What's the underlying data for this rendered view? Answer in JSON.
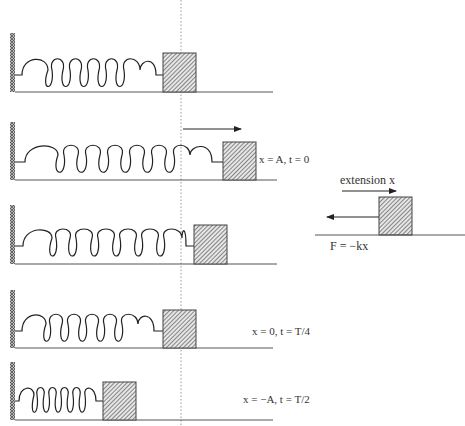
{
  "diagram": {
    "equilibrium_line": {
      "style": "dotted",
      "x": 181
    },
    "panels": [
      {
        "id": "rest",
        "label": "",
        "block_x": 163,
        "ground_y": 92,
        "spring_end": 163,
        "coils": 7,
        "arrow": false
      },
      {
        "id": "extended",
        "label": "x = A, t = 0",
        "block_x": 223,
        "ground_y": 180,
        "spring_end": 223,
        "coils": 6,
        "arrow": true
      },
      {
        "id": "intermediate",
        "label": "",
        "block_x": 194,
        "ground_y": 264,
        "spring_end": 194,
        "coils": 6,
        "arrow": false
      },
      {
        "id": "equilibrium",
        "label": "x = 0, t = T/4",
        "block_x": 163,
        "ground_y": 348,
        "spring_end": 163,
        "coils": 7,
        "arrow": false
      },
      {
        "id": "compressed",
        "label": "x = −A, t = T/2",
        "block_x": 103,
        "ground_y": 420,
        "spring_end": 103,
        "coils": 8,
        "arrow": false
      }
    ],
    "labels": {
      "p2": "x = A, t = 0",
      "p4": "x = 0, t = T/4",
      "p5": "x = −A, t = T/2",
      "extension": "extension x",
      "force": "F = −kx"
    },
    "colors": {
      "line": "#333333",
      "hatch": "#555555",
      "block_fill": "#d8d8d8",
      "dotted": "#999999"
    }
  }
}
